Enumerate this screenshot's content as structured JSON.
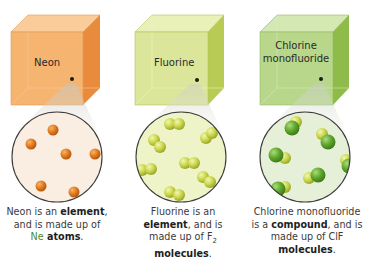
{
  "panels": [
    {
      "name": "Neon",
      "label_lines": [
        "Neon"
      ],
      "cube_colors": {
        "front": "#f5b36e",
        "top": "#f9cd9a",
        "side": "#e8893a",
        "edge": "#d9833a"
      },
      "circle_bg": "#faeee2",
      "particle": {
        "type": "atom",
        "color": "#e07a1f",
        "highlight": "#f6a75a"
      },
      "caption": {
        "line1_pre": "Neon is an ",
        "line1_bold": "element",
        "line1_post": ",",
        "line2": "and is made up of",
        "line3_sym": "Ne",
        "line3_bold": " atoms",
        "line3_post": "."
      }
    },
    {
      "name": "Fluorine",
      "label_lines": [
        "Fluorine"
      ],
      "cube_colors": {
        "front": "#dde79a",
        "top": "#e9f0b8",
        "side": "#b9cc55",
        "edge": "#a9bb50"
      },
      "circle_bg": "#eef3c8",
      "particle": {
        "type": "diatomic-F2",
        "color": "#c9d54a",
        "highlight": "#e7ef8c"
      },
      "caption": {
        "line1": "Fluorine is an",
        "line2_bold": "element",
        "line2_post": ", and is",
        "line3_pre": "made up of F",
        "line3_sub": "2",
        "line4_bold": "molecules",
        "line4_post": "."
      }
    },
    {
      "name": "Chlorine monofluoride",
      "label_lines": [
        "Chlorine",
        "monofluoride"
      ],
      "cube_colors": {
        "front": "#b9d88a",
        "top": "#d4e8b4",
        "side": "#8fbb4a",
        "edge": "#88b050"
      },
      "circle_bg": "#e6efd8",
      "particle": {
        "type": "diatomic-ClF",
        "color_cl": "#5fa52e",
        "color_f": "#d4dc50"
      },
      "caption": {
        "line1": "Chlorine monofluoride",
        "line2_pre": "is a ",
        "line2_bold": "compound",
        "line2_post": ", and is",
        "line3": "made up of ClF",
        "line4_bold": "molecules",
        "line4_post": "."
      }
    }
  ]
}
